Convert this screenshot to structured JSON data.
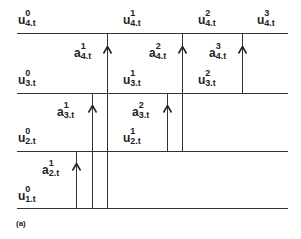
{
  "caption": "(a)",
  "colors": {
    "line": "#333333",
    "text": "#222222",
    "background": "#ffffff"
  },
  "levels": [
    {
      "index": 4,
      "y": 33
    },
    {
      "index": 3,
      "y": 93
    },
    {
      "index": 2,
      "y": 151
    },
    {
      "index": 1,
      "y": 208
    }
  ],
  "u_labels": [
    {
      "id": "u40",
      "base": "u",
      "sup": "0",
      "sub": "4.t",
      "x": 18,
      "y": 14
    },
    {
      "id": "u41",
      "base": "u",
      "sup": "1",
      "sub": "4.t",
      "x": 123,
      "y": 14
    },
    {
      "id": "u42",
      "base": "u",
      "sup": "2",
      "sub": "4.t",
      "x": 198,
      "y": 14
    },
    {
      "id": "u43",
      "base": "u",
      "sup": "3",
      "sub": "4.t",
      "x": 257,
      "y": 14
    },
    {
      "id": "u30",
      "base": "u",
      "sup": "0",
      "sub": "3.t",
      "x": 18,
      "y": 74
    },
    {
      "id": "u31",
      "base": "u",
      "sup": "1",
      "sub": "3.t",
      "x": 123,
      "y": 74
    },
    {
      "id": "u32",
      "base": "u",
      "sup": "2",
      "sub": "3.t",
      "x": 198,
      "y": 74
    },
    {
      "id": "u20",
      "base": "u",
      "sup": "0",
      "sub": "2.t",
      "x": 18,
      "y": 132
    },
    {
      "id": "u21",
      "base": "u",
      "sup": "1",
      "sub": "2.t",
      "x": 123,
      "y": 132
    },
    {
      "id": "u10",
      "base": "u",
      "sup": "0",
      "sub": "1.t",
      "x": 18,
      "y": 190
    }
  ],
  "a_labels": [
    {
      "id": "a41",
      "base": "a",
      "sup": "1",
      "sub": "4.t",
      "x": 74,
      "y": 47
    },
    {
      "id": "a42",
      "base": "a",
      "sup": "2",
      "sub": "4.t",
      "x": 149,
      "y": 47
    },
    {
      "id": "a43",
      "base": "a",
      "sup": "3",
      "sub": "4.t",
      "x": 209,
      "y": 47
    },
    {
      "id": "a31",
      "base": "a",
      "sup": "1",
      "sub": "3.t",
      "x": 57,
      "y": 106
    },
    {
      "id": "a32",
      "base": "a",
      "sup": "2",
      "sub": "3.t",
      "x": 132,
      "y": 106
    },
    {
      "id": "a21",
      "base": "a",
      "sup": "1",
      "sub": "2.t",
      "x": 42,
      "y": 164
    }
  ],
  "verticals": [
    {
      "x": 76,
      "from_y": 151,
      "to_y": 208,
      "arrow_y": 163
    },
    {
      "x": 92,
      "from_y": 93,
      "to_y": 208,
      "arrow_y": 105
    },
    {
      "x": 107,
      "from_y": 33,
      "to_y": 208,
      "arrow_y": 46
    },
    {
      "x": 167,
      "from_y": 93,
      "to_y": 151,
      "arrow_y": 105
    },
    {
      "x": 182,
      "from_y": 33,
      "to_y": 151,
      "arrow_y": 46
    },
    {
      "x": 242,
      "from_y": 33,
      "to_y": 93,
      "arrow_y": 46
    }
  ],
  "line_extent": {
    "x_start": 17,
    "x_end": 288
  }
}
